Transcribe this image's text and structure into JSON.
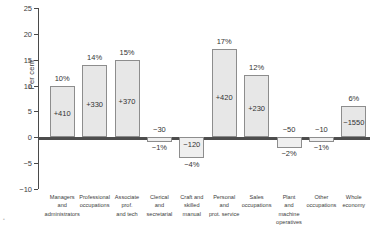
{
  "chart_data": {
    "type": "bar",
    "title": "",
    "xlabel": "",
    "ylabel": "Per cent",
    "ylim": [
      -10,
      25
    ],
    "ytick_values": [
      25,
      20,
      15,
      10,
      5,
      0,
      -5,
      -10
    ],
    "ytick_labels": [
      "25",
      "20",
      "15",
      "10",
      "5",
      "0",
      "-5",
      "-10"
    ],
    "grid": false,
    "legend": null,
    "categories": [
      "Managers and administrators",
      "Professional occupations",
      "Associate prof. and tech",
      "Clerical and secretarial",
      "Craft and skilled manual",
      "Personal and prot. service",
      "Sales occupations",
      "Plant and machine operatives",
      "Other occupations",
      "Whole economy"
    ],
    "category_lines": [
      [
        "Managers",
        "and",
        "administrators"
      ],
      [
        "Professional",
        "occupations"
      ],
      [
        "Associate",
        "prof.",
        "and tech"
      ],
      [
        "Clerical",
        "and",
        "secretarial"
      ],
      [
        "Craft and",
        "skilled",
        "manual"
      ],
      [
        "Personal",
        "and",
        "prot. service"
      ],
      [
        "Sales",
        "occupations"
      ],
      [
        "Plant",
        "and",
        "machine",
        "operatives"
      ],
      [
        "Other",
        "occupations"
      ],
      [
        "Whole",
        "economy"
      ]
    ],
    "values": [
      10,
      14,
      15,
      -1,
      -4,
      17,
      12,
      -2,
      -1,
      6
    ],
    "percent_labels": [
      "10%",
      "14%",
      "15%",
      "-1%",
      "-4%",
      "17%",
      "12%",
      "-2%",
      "-1%",
      "6%"
    ],
    "count_labels": [
      "+410",
      "+330",
      "+370",
      "-30",
      "-120",
      "+420",
      "+230",
      "-50",
      "-10",
      "-1550"
    ],
    "series": [
      {
        "name": "Change in employment",
        "values": [
          10,
          14,
          15,
          -1,
          -4,
          17,
          12,
          -2,
          -1,
          6
        ]
      }
    ]
  },
  "style": {
    "bar_fill": "#e7e7e7",
    "bar_border": "#8d8d8d",
    "axis_color": "#4a4a4a",
    "text_color": "#3d3d3d"
  }
}
